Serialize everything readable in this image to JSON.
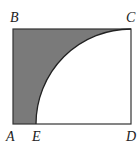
{
  "diagram": {
    "labels": {
      "A": "A",
      "B": "B",
      "C": "C",
      "D": "D",
      "E": "E"
    },
    "colors": {
      "shade": "#7a7a7a",
      "line": "#333333",
      "background": "#ffffff"
    }
  }
}
